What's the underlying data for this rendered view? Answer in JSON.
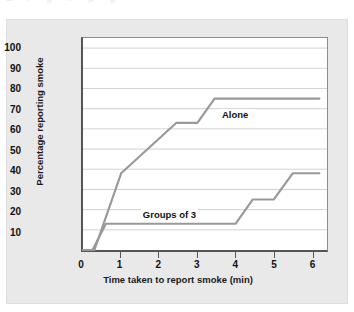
{
  "figure": {
    "background_color": "#e9e9e9",
    "plot_background_color": "#ffffff",
    "top_bleed_text": "a r g n p g"
  },
  "chart_data": {
    "type": "line",
    "title": "",
    "xlabel": "Time taken to report smoke (min)",
    "ylabel": "Percentage reporting smoke",
    "xlim": [
      0,
      6.4
    ],
    "ylim": [
      0,
      105
    ],
    "grid": true,
    "grid_axis": "y",
    "legend_position": "inline-annotation",
    "xticks": [
      0,
      1,
      2,
      3,
      4,
      5,
      6
    ],
    "xtick_labels": [
      "0",
      "1",
      "2",
      "3",
      "4",
      "5",
      "6"
    ],
    "yticks": [
      10,
      20,
      30,
      40,
      50,
      60,
      70,
      80,
      90,
      100
    ],
    "ytick_labels": [
      "10",
      "20",
      "30",
      "40",
      "50",
      "60",
      "70",
      "80",
      "90",
      "100"
    ],
    "line_color": "#999999",
    "series": [
      {
        "name": "Alone",
        "label": "Alone",
        "color": "#999999",
        "points": [
          [
            0.0,
            0
          ],
          [
            0.3,
            0
          ],
          [
            1.0,
            38
          ],
          [
            2.45,
            63
          ],
          [
            3.0,
            63
          ],
          [
            3.45,
            75
          ],
          [
            6.2,
            75
          ]
        ]
      },
      {
        "name": "Groups of 3",
        "label": "Groups of 3",
        "color": "#999999",
        "points": [
          [
            0.0,
            0
          ],
          [
            0.25,
            0
          ],
          [
            0.6,
            13
          ],
          [
            4.0,
            13
          ],
          [
            4.45,
            25
          ],
          [
            5.0,
            25
          ],
          [
            5.5,
            38
          ],
          [
            6.2,
            38
          ]
        ]
      }
    ],
    "annotations": [
      {
        "text": "Alone",
        "x": 3.6,
        "y": 67
      },
      {
        "text": "Groups of 3",
        "x": 1.55,
        "y": 18
      }
    ]
  }
}
